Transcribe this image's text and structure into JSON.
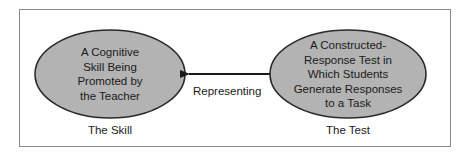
{
  "diagram": {
    "left_node": {
      "text": "A Cognitive Skill Being Promoted by the Teacher",
      "lines": [
        "A Cognitive",
        "Skill Being",
        "Promoted by",
        "the Teacher"
      ],
      "caption": "The Skill"
    },
    "right_node": {
      "text": "A Constructed-Response Test in Which Students Generate Responses to a Task",
      "lines": [
        "A Constructed-",
        "Response Test in",
        "Which Students",
        "Generate Responses",
        "to a Task"
      ],
      "caption": "The Test"
    },
    "edge": {
      "label": "Representing",
      "from": "right_node",
      "to": "left_node"
    },
    "colors": {
      "ellipse_fill": "#b3b3b3",
      "ellipse_stroke": "#2a2a2a",
      "frame": "#8a8a8a",
      "arrow": "#1a1a1a"
    }
  }
}
